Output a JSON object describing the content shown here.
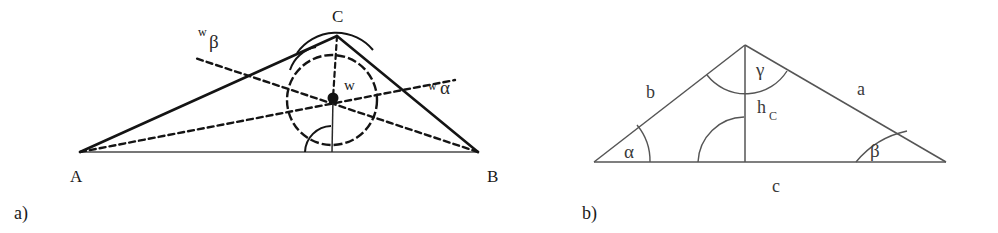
{
  "figure": {
    "caption_a": "a)",
    "caption_b": "b)"
  },
  "panel_a": {
    "title_role": "triangle-with-incircle-and-angle-bisectors",
    "vertices": {
      "A": "A",
      "B": "B",
      "C": "C"
    },
    "labels": {
      "incenter": "w",
      "bisector_beta_prefix": "w",
      "bisector_beta_greek": "β",
      "bisector_alpha_prefix": "w",
      "bisector_alpha_greek": "α"
    },
    "geometry": {
      "A": [
        80,
        152
      ],
      "B": [
        478,
        152
      ],
      "C": [
        337,
        36
      ],
      "incenter": [
        333,
        98
      ],
      "incircle_center": [
        332,
        100
      ],
      "incircle_radius": 45,
      "foot_on_AB": [
        332,
        152
      ]
    }
  },
  "panel_b": {
    "title_role": "triangle-with-height-and-angles",
    "side_labels": {
      "a": "a",
      "b": "b",
      "c": "c",
      "height_base": "h",
      "height_sub": "C"
    },
    "angle_labels": {
      "alpha": "α",
      "beta": "β",
      "gamma": "γ"
    },
    "geometry": {
      "left": [
        74,
        162
      ],
      "right": [
        426,
        162
      ],
      "apex": [
        225,
        45
      ],
      "foot": [
        225,
        162
      ]
    }
  },
  "colors": {
    "ink": "#141414",
    "ink_soft": "#555555",
    "background": "#ffffff"
  }
}
